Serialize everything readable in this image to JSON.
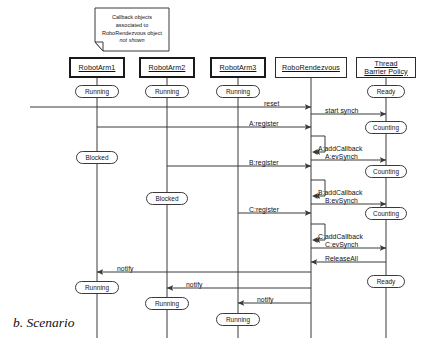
{
  "figure": {
    "caption": "b. Scenario",
    "note": {
      "lines": [
        "Callback objects",
        "associated to",
        "RoboRendezvous object"
      ],
      "italic_line": "not shown"
    }
  },
  "lifelines": [
    {
      "id": "arm1",
      "label": "RobotArm1",
      "x": 97,
      "box_w": 56,
      "box_x": 69,
      "bold": true
    },
    {
      "id": "arm2",
      "label": "RobotArm2",
      "x": 167,
      "box_w": 56,
      "box_x": 139,
      "bold": true
    },
    {
      "id": "arm3",
      "label": "RobotArm3",
      "x": 238,
      "box_w": 56,
      "box_x": 210,
      "bold": true
    },
    {
      "id": "rendez",
      "label": "RoboRendezvous",
      "x": 311,
      "box_w": 72,
      "box_x": 275,
      "bold": false
    },
    {
      "id": "tbp",
      "label": "Thread\nBarrier Policy",
      "x": 386,
      "box_w": 60,
      "box_x": 356,
      "bold": false
    }
  ],
  "states": [
    {
      "label": "Running",
      "lifeline": "arm1",
      "y": 91,
      "w": 44
    },
    {
      "label": "Running",
      "lifeline": "arm2",
      "y": 91,
      "w": 44
    },
    {
      "label": "Running",
      "lifeline": "arm3",
      "y": 91,
      "w": 44
    },
    {
      "label": "Ready",
      "lifeline": "tbp",
      "y": 91,
      "w": 38
    },
    {
      "label": "Counting",
      "lifeline": "tbp",
      "y": 127,
      "w": 42
    },
    {
      "label": "Blocked",
      "lifeline": "arm1",
      "y": 157,
      "w": 42
    },
    {
      "label": "Counting",
      "lifeline": "tbp",
      "y": 171,
      "w": 42
    },
    {
      "label": "Blocked",
      "lifeline": "arm2",
      "y": 198,
      "w": 42
    },
    {
      "label": "Counting",
      "lifeline": "tbp",
      "y": 213,
      "w": 42
    },
    {
      "label": "Ready",
      "lifeline": "tbp",
      "y": 281,
      "w": 38
    },
    {
      "label": "Running",
      "lifeline": "arm1",
      "y": 287,
      "w": 44
    },
    {
      "label": "Running",
      "lifeline": "arm2",
      "y": 303,
      "w": 44
    },
    {
      "label": "Running",
      "lifeline": "arm3",
      "y": 319,
      "w": 44
    }
  ],
  "messages": [
    {
      "id": "m01",
      "label": "reset",
      "from": "edge-left",
      "to": "rendez",
      "y": 107,
      "lx": 264,
      "ly": 100,
      "dir": "right"
    },
    {
      "id": "m02",
      "label": "start synch",
      "from": "rendez",
      "to": "tbp",
      "y": 114,
      "lx": 325,
      "ly": 107,
      "dir": "right"
    },
    {
      "id": "m03",
      "label": "A:register",
      "from": "arm1",
      "to": "rendez",
      "y": 127,
      "lx": 249,
      "ly": 120,
      "dir": "right"
    },
    {
      "id": "m04",
      "label": "A:addCallback",
      "from": "rendez",
      "to": "rendez",
      "y": 152,
      "lx": 318,
      "ly": 145,
      "dir": "self"
    },
    {
      "id": "m05",
      "label": "A:evSynch",
      "from": "rendez",
      "to": "tbp",
      "y": 160,
      "lx": 325,
      "ly": 153,
      "dir": "right"
    },
    {
      "id": "m06",
      "label": "B:register",
      "from": "arm2",
      "to": "rendez",
      "y": 166,
      "lx": 249,
      "ly": 159,
      "dir": "right"
    },
    {
      "id": "m07",
      "label": "B:addCallback",
      "from": "rendez",
      "to": "rendez",
      "y": 196,
      "lx": 318,
      "ly": 189,
      "dir": "self"
    },
    {
      "id": "m08",
      "label": "B:evSynch",
      "from": "rendez",
      "to": "tbp",
      "y": 204,
      "lx": 325,
      "ly": 197,
      "dir": "right"
    },
    {
      "id": "m09",
      "label": "C:register",
      "from": "arm3",
      "to": "rendez",
      "y": 213,
      "lx": 249,
      "ly": 206,
      "dir": "right"
    },
    {
      "id": "m10",
      "label": "C:addCallback",
      "from": "rendez",
      "to": "rendez",
      "y": 240,
      "lx": 318,
      "ly": 233,
      "dir": "self"
    },
    {
      "id": "m11",
      "label": "C:evSynch",
      "from": "rendez",
      "to": "tbp",
      "y": 248,
      "lx": 325,
      "ly": 241,
      "dir": "right"
    },
    {
      "id": "m12",
      "label": "ReleaseAll",
      "from": "tbp",
      "to": "rendez",
      "y": 262,
      "lx": 325,
      "ly": 255,
      "dir": "left"
    },
    {
      "id": "m13",
      "label": "notify",
      "from": "rendez",
      "to": "arm1",
      "y": 272,
      "lx": 117,
      "ly": 265,
      "dir": "left"
    },
    {
      "id": "m14",
      "label": "notify",
      "from": "rendez",
      "to": "arm2",
      "y": 288,
      "lx": 186,
      "ly": 281,
      "dir": "left"
    },
    {
      "id": "m15",
      "label": "notify",
      "from": "rendez",
      "to": "arm3",
      "y": 303,
      "lx": 257,
      "ly": 296,
      "dir": "left"
    }
  ],
  "colors": {
    "line": "#3a3a3a",
    "text": "#111111",
    "background": "#ffffff"
  }
}
